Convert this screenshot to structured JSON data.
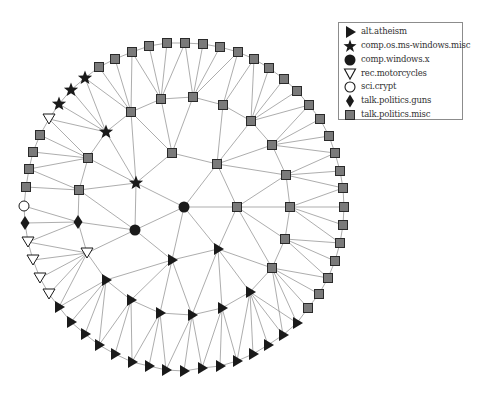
{
  "figure": {
    "type": "graph-network",
    "legend": {
      "items": [
        {
          "label": "alt.atheism",
          "shape": "triangle-right",
          "icon": "filled-right-triangle-icon"
        },
        {
          "label": "comp.os.ms-windows.misc",
          "shape": "star",
          "icon": "filled-star-icon"
        },
        {
          "label": "comp.windows.x",
          "shape": "circle",
          "icon": "filled-circle-icon"
        },
        {
          "label": "rec.motorcycles",
          "shape": "triangle-down-open",
          "icon": "open-down-triangle-icon"
        },
        {
          "label": "sci.crypt",
          "shape": "circle-open",
          "icon": "open-circle-icon"
        },
        {
          "label": "talk.politics.guns",
          "shape": "diamond",
          "icon": "filled-diamond-icon"
        },
        {
          "label": "talk.politics.misc",
          "shape": "square",
          "icon": "gray-square-icon"
        }
      ]
    },
    "colors": {
      "edge": "#8a8a8a",
      "filled": "#1a1a1a",
      "square_fill": "#7a7a7a",
      "square_stroke": "#2a2a2a",
      "open_fill": "#ffffff",
      "legend_border": "#8c8c8c"
    },
    "nodes": [
      {
        "id": "o1",
        "x": 99,
        "y": 67,
        "shape": "square"
      },
      {
        "id": "o2",
        "x": 115,
        "y": 59,
        "shape": "square"
      },
      {
        "id": "o3",
        "x": 132,
        "y": 52,
        "shape": "square"
      },
      {
        "id": "o4",
        "x": 149,
        "y": 46,
        "shape": "square"
      },
      {
        "id": "o5",
        "x": 167,
        "y": 43,
        "shape": "square"
      },
      {
        "id": "o6",
        "x": 185,
        "y": 43,
        "shape": "square"
      },
      {
        "id": "o7",
        "x": 203,
        "y": 44,
        "shape": "square"
      },
      {
        "id": "o8",
        "x": 220,
        "y": 47,
        "shape": "square"
      },
      {
        "id": "o9",
        "x": 238,
        "y": 52,
        "shape": "square"
      },
      {
        "id": "o10",
        "x": 254,
        "y": 59,
        "shape": "square"
      },
      {
        "id": "o11",
        "x": 269,
        "y": 68,
        "shape": "square"
      },
      {
        "id": "o12",
        "x": 284,
        "y": 79,
        "shape": "square"
      },
      {
        "id": "o13",
        "x": 297,
        "y": 91,
        "shape": "square"
      },
      {
        "id": "o14",
        "x": 309,
        "y": 105,
        "shape": "square"
      },
      {
        "id": "o15",
        "x": 320,
        "y": 119,
        "shape": "square"
      },
      {
        "id": "o16",
        "x": 329,
        "y": 136,
        "shape": "square"
      },
      {
        "id": "o17",
        "x": 335,
        "y": 153,
        "shape": "square"
      },
      {
        "id": "o18",
        "x": 340,
        "y": 171,
        "shape": "square"
      },
      {
        "id": "o19",
        "x": 343,
        "y": 188,
        "shape": "square"
      },
      {
        "id": "o20",
        "x": 344,
        "y": 207,
        "shape": "square"
      },
      {
        "id": "o21",
        "x": 343,
        "y": 225,
        "shape": "square"
      },
      {
        "id": "o22",
        "x": 340,
        "y": 243,
        "shape": "square"
      },
      {
        "id": "o23",
        "x": 335,
        "y": 261,
        "shape": "square"
      },
      {
        "id": "o24",
        "x": 328,
        "y": 278,
        "shape": "square"
      },
      {
        "id": "o25",
        "x": 319,
        "y": 294,
        "shape": "square"
      },
      {
        "id": "o26",
        "x": 308,
        "y": 308,
        "shape": "square"
      },
      {
        "id": "o27",
        "x": 297,
        "y": 323,
        "shape": "triangle-right"
      },
      {
        "id": "o28",
        "x": 283,
        "y": 335,
        "shape": "triangle-right"
      },
      {
        "id": "o29",
        "x": 268,
        "y": 345,
        "shape": "triangle-right"
      },
      {
        "id": "o30",
        "x": 253,
        "y": 354,
        "shape": "triangle-right"
      },
      {
        "id": "o31",
        "x": 237,
        "y": 361,
        "shape": "triangle-right"
      },
      {
        "id": "o32",
        "x": 220,
        "y": 366,
        "shape": "triangle-right"
      },
      {
        "id": "o33",
        "x": 202,
        "y": 368,
        "shape": "triangle-right"
      },
      {
        "id": "o34",
        "x": 184,
        "y": 371,
        "shape": "triangle-right"
      },
      {
        "id": "o35",
        "x": 166,
        "y": 370,
        "shape": "triangle-right"
      },
      {
        "id": "o36",
        "x": 149,
        "y": 366,
        "shape": "triangle-right"
      },
      {
        "id": "o37",
        "x": 132,
        "y": 362,
        "shape": "triangle-right"
      },
      {
        "id": "o38",
        "x": 115,
        "y": 354,
        "shape": "triangle-right"
      },
      {
        "id": "o39",
        "x": 99,
        "y": 345,
        "shape": "triangle-right"
      },
      {
        "id": "o40",
        "x": 85,
        "y": 334,
        "shape": "triangle-right"
      },
      {
        "id": "o41",
        "x": 71,
        "y": 322,
        "shape": "triangle-right"
      },
      {
        "id": "o42",
        "x": 59,
        "y": 307,
        "shape": "triangle-right"
      },
      {
        "id": "o43",
        "x": 49,
        "y": 294,
        "shape": "triangle-down-open"
      },
      {
        "id": "o44",
        "x": 40,
        "y": 278,
        "shape": "triangle-down-open"
      },
      {
        "id": "o45",
        "x": 33,
        "y": 260,
        "shape": "triangle-down-open"
      },
      {
        "id": "o46",
        "x": 28,
        "y": 242,
        "shape": "triangle-down-open"
      },
      {
        "id": "o47",
        "x": 25,
        "y": 223,
        "shape": "diamond"
      },
      {
        "id": "o48",
        "x": 24,
        "y": 206,
        "shape": "circle-open"
      },
      {
        "id": "o49",
        "x": 26,
        "y": 187,
        "shape": "square"
      },
      {
        "id": "o50",
        "x": 29,
        "y": 169,
        "shape": "square"
      },
      {
        "id": "o51",
        "x": 33,
        "y": 152,
        "shape": "square"
      },
      {
        "id": "o52",
        "x": 40,
        "y": 135,
        "shape": "square"
      },
      {
        "id": "o53",
        "x": 49,
        "y": 119,
        "shape": "triangle-down-open"
      },
      {
        "id": "o54",
        "x": 59,
        "y": 104,
        "shape": "star"
      },
      {
        "id": "o55",
        "x": 71,
        "y": 90,
        "shape": "star"
      },
      {
        "id": "o56",
        "x": 85,
        "y": 78,
        "shape": "star"
      },
      {
        "id": "A",
        "x": 131,
        "y": 112,
        "shape": "square"
      },
      {
        "id": "B",
        "x": 161,
        "y": 99,
        "shape": "square"
      },
      {
        "id": "C",
        "x": 193,
        "y": 97,
        "shape": "square"
      },
      {
        "id": "D",
        "x": 223,
        "y": 105,
        "shape": "square"
      },
      {
        "id": "E",
        "x": 251,
        "y": 121,
        "shape": "square"
      },
      {
        "id": "J",
        "x": 272,
        "y": 145,
        "shape": "square"
      },
      {
        "id": "I",
        "x": 286,
        "y": 175,
        "shape": "square"
      },
      {
        "id": "K",
        "x": 290,
        "y": 207,
        "shape": "square"
      },
      {
        "id": "L",
        "x": 285,
        "y": 239,
        "shape": "square"
      },
      {
        "id": "M",
        "x": 272,
        "y": 268,
        "shape": "square"
      },
      {
        "id": "F",
        "x": 172,
        "y": 153,
        "shape": "square"
      },
      {
        "id": "G",
        "x": 217,
        "y": 164,
        "shape": "square"
      },
      {
        "id": "H",
        "x": 237,
        "y": 207,
        "shape": "square"
      },
      {
        "id": "S1",
        "x": 106,
        "y": 132,
        "shape": "star"
      },
      {
        "id": "S2",
        "x": 136,
        "y": 183,
        "shape": "star"
      },
      {
        "id": "Q",
        "x": 88,
        "y": 158,
        "shape": "square"
      },
      {
        "id": "P",
        "x": 79,
        "y": 190,
        "shape": "square"
      },
      {
        "id": "C1",
        "x": 184,
        "y": 207,
        "shape": "circle"
      },
      {
        "id": "C2",
        "x": 135,
        "y": 230,
        "shape": "circle"
      },
      {
        "id": "Dm",
        "x": 78,
        "y": 222,
        "shape": "diamond"
      },
      {
        "id": "O1",
        "x": 87,
        "y": 253,
        "shape": "triangle-down-open"
      },
      {
        "id": "T1",
        "x": 172,
        "y": 260,
        "shape": "triangle-right"
      },
      {
        "id": "T2",
        "x": 218,
        "y": 249,
        "shape": "triangle-right"
      },
      {
        "id": "T3",
        "x": 106,
        "y": 280,
        "shape": "triangle-right"
      },
      {
        "id": "T4",
        "x": 131,
        "y": 300,
        "shape": "triangle-right"
      },
      {
        "id": "T5",
        "x": 160,
        "y": 313,
        "shape": "triangle-right"
      },
      {
        "id": "T6",
        "x": 192,
        "y": 315,
        "shape": "triangle-right"
      },
      {
        "id": "T7",
        "x": 222,
        "y": 308,
        "shape": "triangle-right"
      },
      {
        "id": "T8",
        "x": 250,
        "y": 292,
        "shape": "triangle-right"
      }
    ],
    "edges": [
      [
        "o1",
        "o2"
      ],
      [
        "o2",
        "o3"
      ],
      [
        "o3",
        "o4"
      ],
      [
        "o4",
        "o5"
      ],
      [
        "o5",
        "o6"
      ],
      [
        "o6",
        "o7"
      ],
      [
        "o7",
        "o8"
      ],
      [
        "o8",
        "o9"
      ],
      [
        "o9",
        "o10"
      ],
      [
        "o10",
        "o11"
      ],
      [
        "o11",
        "o12"
      ],
      [
        "o12",
        "o13"
      ],
      [
        "o13",
        "o14"
      ],
      [
        "o14",
        "o15"
      ],
      [
        "o15",
        "o16"
      ],
      [
        "o16",
        "o17"
      ],
      [
        "o17",
        "o18"
      ],
      [
        "o18",
        "o19"
      ],
      [
        "o19",
        "o20"
      ],
      [
        "o20",
        "o21"
      ],
      [
        "o21",
        "o22"
      ],
      [
        "o22",
        "o23"
      ],
      [
        "o23",
        "o24"
      ],
      [
        "o24",
        "o25"
      ],
      [
        "o25",
        "o26"
      ],
      [
        "o26",
        "o27"
      ],
      [
        "o27",
        "o28"
      ],
      [
        "o28",
        "o29"
      ],
      [
        "o29",
        "o30"
      ],
      [
        "o30",
        "o31"
      ],
      [
        "o31",
        "o32"
      ],
      [
        "o32",
        "o33"
      ],
      [
        "o33",
        "o34"
      ],
      [
        "o34",
        "o35"
      ],
      [
        "o35",
        "o36"
      ],
      [
        "o36",
        "o37"
      ],
      [
        "o37",
        "o38"
      ],
      [
        "o38",
        "o39"
      ],
      [
        "o39",
        "o40"
      ],
      [
        "o40",
        "o41"
      ],
      [
        "o41",
        "o42"
      ],
      [
        "o42",
        "o43"
      ],
      [
        "o43",
        "o44"
      ],
      [
        "o44",
        "o45"
      ],
      [
        "o45",
        "o46"
      ],
      [
        "o46",
        "o47"
      ],
      [
        "o47",
        "o48"
      ],
      [
        "o48",
        "o49"
      ],
      [
        "o49",
        "o50"
      ],
      [
        "o50",
        "o51"
      ],
      [
        "o51",
        "o52"
      ],
      [
        "o52",
        "o53"
      ],
      [
        "o53",
        "o54"
      ],
      [
        "o54",
        "o55"
      ],
      [
        "o55",
        "o56"
      ],
      [
        "o56",
        "o1"
      ],
      [
        "o1",
        "A"
      ],
      [
        "o2",
        "A"
      ],
      [
        "o3",
        "A"
      ],
      [
        "o3",
        "B"
      ],
      [
        "o4",
        "B"
      ],
      [
        "o5",
        "B"
      ],
      [
        "o6",
        "B"
      ],
      [
        "o6",
        "C"
      ],
      [
        "o7",
        "C"
      ],
      [
        "o8",
        "C"
      ],
      [
        "o9",
        "C"
      ],
      [
        "o9",
        "D"
      ],
      [
        "o10",
        "D"
      ],
      [
        "o10",
        "E"
      ],
      [
        "o11",
        "E"
      ],
      [
        "o12",
        "E"
      ],
      [
        "o13",
        "E"
      ],
      [
        "o14",
        "E"
      ],
      [
        "o14",
        "J"
      ],
      [
        "o15",
        "J"
      ],
      [
        "o16",
        "J"
      ],
      [
        "o17",
        "J"
      ],
      [
        "o17",
        "I"
      ],
      [
        "o18",
        "I"
      ],
      [
        "o19",
        "I"
      ],
      [
        "o19",
        "K"
      ],
      [
        "o20",
        "K"
      ],
      [
        "o21",
        "K"
      ],
      [
        "o22",
        "K"
      ],
      [
        "o22",
        "L"
      ],
      [
        "o23",
        "L"
      ],
      [
        "o24",
        "L"
      ],
      [
        "o24",
        "M"
      ],
      [
        "o25",
        "M"
      ],
      [
        "o26",
        "M"
      ],
      [
        "o27",
        "M"
      ],
      [
        "o28",
        "M"
      ],
      [
        "o27",
        "T8"
      ],
      [
        "o28",
        "T8"
      ],
      [
        "o29",
        "T8"
      ],
      [
        "o30",
        "T8"
      ],
      [
        "o31",
        "T8"
      ],
      [
        "o31",
        "T7"
      ],
      [
        "o32",
        "T7"
      ],
      [
        "o33",
        "T7"
      ],
      [
        "o33",
        "T6"
      ],
      [
        "o34",
        "T6"
      ],
      [
        "o35",
        "T6"
      ],
      [
        "o35",
        "T5"
      ],
      [
        "o36",
        "T5"
      ],
      [
        "o37",
        "T5"
      ],
      [
        "o37",
        "T4"
      ],
      [
        "o38",
        "T4"
      ],
      [
        "o39",
        "T4"
      ],
      [
        "o39",
        "T3"
      ],
      [
        "o40",
        "T3"
      ],
      [
        "o41",
        "T3"
      ],
      [
        "o42",
        "T3"
      ],
      [
        "o42",
        "O1"
      ],
      [
        "o43",
        "O1"
      ],
      [
        "o44",
        "O1"
      ],
      [
        "o45",
        "O1"
      ],
      [
        "o46",
        "O1"
      ],
      [
        "o46",
        "Dm"
      ],
      [
        "o47",
        "Dm"
      ],
      [
        "o48",
        "Dm"
      ],
      [
        "o49",
        "P"
      ],
      [
        "o50",
        "P"
      ],
      [
        "o50",
        "Q"
      ],
      [
        "o51",
        "Q"
      ],
      [
        "o52",
        "Q"
      ],
      [
        "o53",
        "Q"
      ],
      [
        "o53",
        "S1"
      ],
      [
        "o54",
        "S1"
      ],
      [
        "o55",
        "S1"
      ],
      [
        "o56",
        "S1"
      ],
      [
        "o56",
        "A"
      ],
      [
        "A",
        "B"
      ],
      [
        "B",
        "C"
      ],
      [
        "C",
        "D"
      ],
      [
        "D",
        "E"
      ],
      [
        "E",
        "J"
      ],
      [
        "J",
        "I"
      ],
      [
        "I",
        "K"
      ],
      [
        "K",
        "L"
      ],
      [
        "L",
        "M"
      ],
      [
        "A",
        "S1"
      ],
      [
        "A",
        "F"
      ],
      [
        "A",
        "S2"
      ],
      [
        "B",
        "F"
      ],
      [
        "C",
        "F"
      ],
      [
        "D",
        "G"
      ],
      [
        "E",
        "G"
      ],
      [
        "J",
        "G"
      ],
      [
        "I",
        "G"
      ],
      [
        "F",
        "G"
      ],
      [
        "F",
        "S2"
      ],
      [
        "S1",
        "Q"
      ],
      [
        "S1",
        "S2"
      ],
      [
        "Q",
        "S2"
      ],
      [
        "Q",
        "P"
      ],
      [
        "P",
        "S2"
      ],
      [
        "P",
        "Dm"
      ],
      [
        "P",
        "C2"
      ],
      [
        "S2",
        "C2"
      ],
      [
        "S2",
        "C1"
      ],
      [
        "G",
        "C1"
      ],
      [
        "G",
        "H"
      ],
      [
        "H",
        "I"
      ],
      [
        "H",
        "K"
      ],
      [
        "H",
        "L"
      ],
      [
        "H",
        "M"
      ],
      [
        "C1",
        "H"
      ],
      [
        "C1",
        "C2"
      ],
      [
        "C1",
        "T1"
      ],
      [
        "C1",
        "T2"
      ],
      [
        "H",
        "T2"
      ],
      [
        "C2",
        "Dm"
      ],
      [
        "C2",
        "T1"
      ],
      [
        "C2",
        "O1"
      ],
      [
        "Dm",
        "O1"
      ],
      [
        "O1",
        "T3"
      ],
      [
        "T1",
        "T3"
      ],
      [
        "T1",
        "T4"
      ],
      [
        "T1",
        "T5"
      ],
      [
        "T1",
        "T6"
      ],
      [
        "T1",
        "T2"
      ],
      [
        "T2",
        "T6"
      ],
      [
        "T2",
        "T7"
      ],
      [
        "T2",
        "T8"
      ],
      [
        "T2",
        "M"
      ],
      [
        "M",
        "T8"
      ],
      [
        "T3",
        "T4"
      ],
      [
        "T4",
        "T5"
      ],
      [
        "T5",
        "T6"
      ],
      [
        "T6",
        "T7"
      ],
      [
        "T7",
        "T8"
      ]
    ]
  }
}
